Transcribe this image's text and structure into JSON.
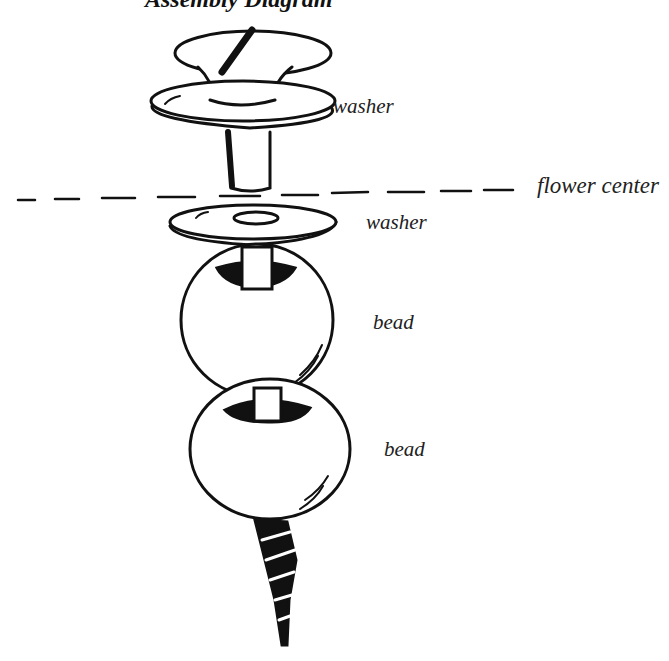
{
  "diagram": {
    "title": "Assembly Diagram",
    "labels": {
      "washer_top": "washer",
      "flower_center": "flower center",
      "washer_bottom": "washer",
      "bead_top": "bead",
      "bead_bottom": "bead"
    },
    "components_top_to_bottom": [
      "knob",
      "washer",
      "flower center line",
      "washer",
      "bead",
      "bead",
      "screw"
    ]
  }
}
